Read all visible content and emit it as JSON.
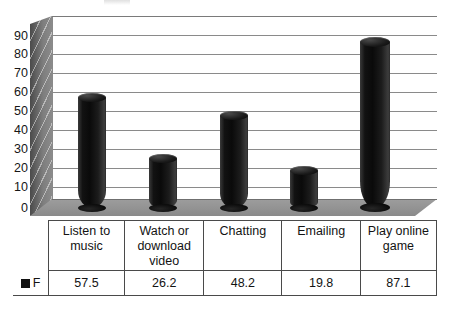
{
  "chart_data": {
    "type": "bar",
    "title": "",
    "xlabel": "",
    "ylabel": "",
    "ylim": [
      0,
      90
    ],
    "ytick_step": 10,
    "yticks": [
      "90",
      "80",
      "70",
      "60",
      "50",
      "40",
      "30",
      "20",
      "10",
      "0"
    ],
    "grid": true,
    "legend_position": "data-table-row",
    "style": "3d-cylinder",
    "categories": [
      "Listen to music",
      "Watch or download video",
      "Chatting",
      "Emailing",
      "Play online game"
    ],
    "series": [
      {
        "name": "F",
        "marker_color": "#111111",
        "values": [
          57.5,
          26.2,
          48.2,
          19.8,
          87.1
        ]
      }
    ]
  },
  "data_table": {
    "legend_label": "F",
    "legend_swatch_icon": "black-square-marker",
    "columns": [
      "Listen to music",
      "Watch or download video",
      "Chatting",
      "Emailing",
      "Play online game"
    ],
    "values": [
      "57.5",
      "26.2",
      "48.2",
      "19.8",
      "87.1"
    ]
  },
  "colors": {
    "bar_fill": "#0f0f0f",
    "floor": "#9a9a9a",
    "back_wall": "#7e7e7e",
    "gridline": "#8a8a8a",
    "text": "#161616",
    "table_border": "#4a4a4a"
  }
}
